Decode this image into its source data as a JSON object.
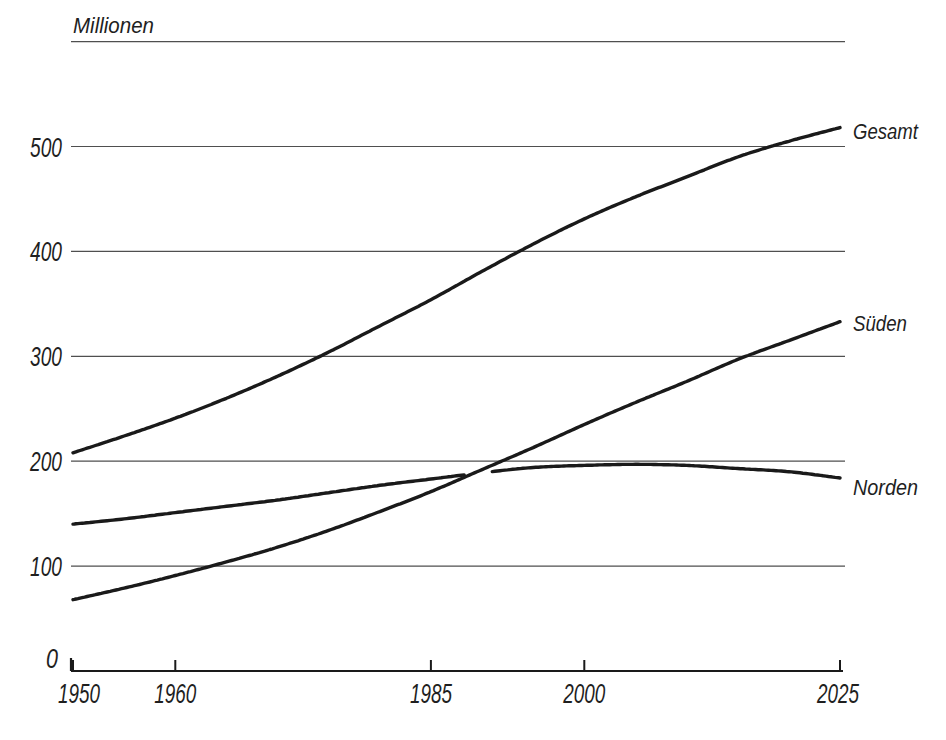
{
  "chart_data": {
    "type": "line",
    "title": "",
    "unit_label": "Millionen",
    "xlabel": "",
    "ylabel": "Millionen",
    "x": [
      1950,
      1955,
      1960,
      1965,
      1970,
      1975,
      1980,
      1985,
      1990,
      1995,
      2000,
      2005,
      2010,
      2015,
      2020,
      2025
    ],
    "series": [
      {
        "name": "Gesamt",
        "values": [
          208,
          224,
          241,
          260,
          281,
          304,
          329,
          354,
          381,
          407,
          431,
          452,
          471,
          490,
          505,
          518
        ]
      },
      {
        "name": "Süden",
        "values": [
          68,
          79,
          91,
          104,
          118,
          134,
          152,
          171,
          192,
          213,
          235,
          256,
          276,
          297,
          315,
          333
        ]
      },
      {
        "name": "Norden",
        "values": [
          140,
          145,
          151,
          157,
          163,
          170,
          177,
          183,
          189,
          194,
          196,
          197,
          196,
          193,
          190,
          184
        ]
      }
    ],
    "xticks": [
      1950,
      1960,
      1985,
      2000,
      2025
    ],
    "yticks": [
      0,
      100,
      200,
      300,
      400,
      500
    ],
    "xlim": [
      1950,
      2025
    ],
    "ylim": [
      0,
      600
    ],
    "grid": "horizontal-only",
    "legend_position": "right-end-labels",
    "line_color": "#1a1a1a",
    "grid_color": "#4f4f4f",
    "axis_color": "#1a1a1a",
    "background": "#ffffff"
  }
}
